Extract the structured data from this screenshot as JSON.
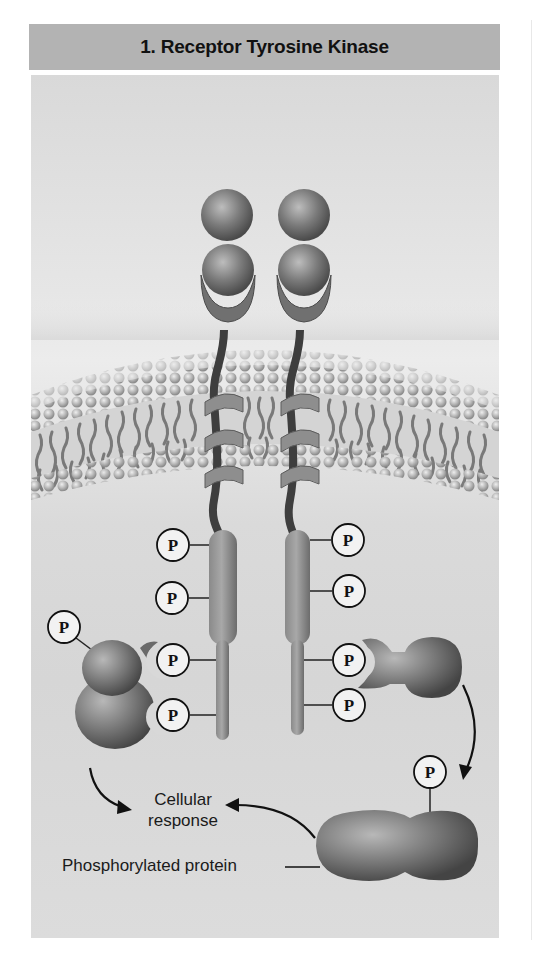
{
  "header": {
    "title": "1. Receptor Tyrosine Kinase"
  },
  "labels": {
    "cellular_response_line1": "Cellular",
    "cellular_response_line2": "response",
    "phosphorylated_protein": "Phosphorylated protein"
  },
  "phosphate_symbol": "P",
  "phosphate_groups": [
    {
      "id": "receptor-left-1",
      "cx": 173,
      "cy": 545
    },
    {
      "id": "receptor-left-2",
      "cx": 172,
      "cy": 598
    },
    {
      "id": "receptor-left-3",
      "cx": 173,
      "cy": 660
    },
    {
      "id": "receptor-left-4",
      "cx": 173,
      "cy": 715
    },
    {
      "id": "receptor-right-1",
      "cx": 348,
      "cy": 540
    },
    {
      "id": "receptor-right-2",
      "cx": 349,
      "cy": 591
    },
    {
      "id": "receptor-right-3",
      "cx": 349,
      "cy": 660
    },
    {
      "id": "receptor-right-4",
      "cx": 349,
      "cy": 705
    },
    {
      "id": "relay-protein-left",
      "cx": 64,
      "cy": 627
    },
    {
      "id": "phosphorylated-protein",
      "cx": 430,
      "cy": 772
    }
  ],
  "colors": {
    "header_bg": "#b3b3b3",
    "panel_bg": "#e0e0e0",
    "protein": "#6e6e6e",
    "protein_highlight": "#b5b5b5",
    "phosphate_fill": "#f2f2f2",
    "ink": "#111111"
  }
}
